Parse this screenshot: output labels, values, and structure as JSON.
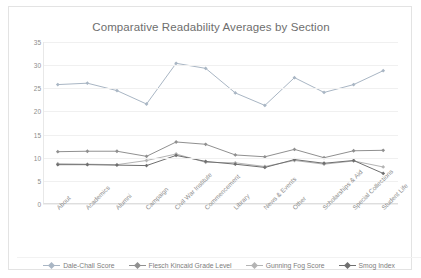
{
  "chart_data": {
    "type": "line",
    "title": "Comparative Readability Averages by Section",
    "xlabel": "",
    "ylabel": "",
    "ylim": [
      0,
      35
    ],
    "yticks": [
      0,
      5,
      10,
      15,
      20,
      25,
      30,
      35
    ],
    "grid": true,
    "legend_position": "bottom",
    "categories": [
      "About",
      "Academics",
      "Alumni",
      "Campaign",
      "Civil War Institute",
      "Commencement",
      "Library",
      "News & Events",
      "Other",
      "Scholarships & Aid",
      "Special Collections",
      "Student Life"
    ],
    "series": [
      {
        "name": "Dale-Chall Score",
        "color": "#a9b6c4",
        "values": [
          25.8,
          26.1,
          24.5,
          21.6,
          30.4,
          29.3,
          24.0,
          21.3,
          27.3,
          24.1,
          25.8,
          28.8
        ]
      },
      {
        "name": "Flesch Kincaid Grade Level",
        "color": "#909090",
        "values": [
          11.3,
          11.4,
          11.4,
          10.3,
          13.4,
          12.9,
          10.6,
          10.2,
          11.8,
          10.0,
          11.5,
          11.6
        ]
      },
      {
        "name": "Gunning Fog Score",
        "color": "#b4b4b4",
        "values": [
          8.7,
          8.6,
          8.5,
          9.4,
          10.8,
          9.0,
          8.9,
          8.1,
          9.4,
          8.6,
          9.3,
          8.0
        ]
      },
      {
        "name": "Smog Index",
        "color": "#6f6f6f",
        "values": [
          8.5,
          8.5,
          8.4,
          8.3,
          10.5,
          9.2,
          8.6,
          7.9,
          9.6,
          8.8,
          9.4,
          6.6
        ]
      }
    ]
  }
}
